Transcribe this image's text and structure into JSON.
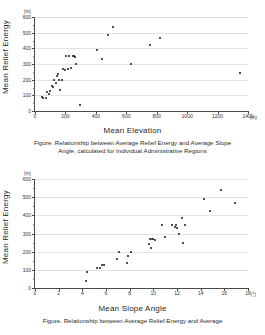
{
  "figures": [
    {
      "id": "relief-vs-elevation",
      "y_axis": {
        "title": "Mean Relief Energy",
        "unit": "(m)",
        "ticks": [
          0,
          100,
          200,
          300,
          400,
          500,
          600
        ],
        "min": 0,
        "max": 600
      },
      "x_axis": {
        "title": "Mean Elevation",
        "unit": "(m)",
        "ticks": [
          0,
          200,
          400,
          600,
          800,
          1000,
          1200,
          1400
        ],
        "min": 0,
        "max": 1400
      },
      "caption_line1": "Figure. Relationship between Average Relief Energy and Average Slope",
      "caption_line2": "Angle, calculated for Individual Administrative Regions"
    },
    {
      "id": "relief-vs-slope",
      "y_axis": {
        "title": "Mean Relief Energy",
        "unit": "(m)",
        "ticks": [
          0,
          100,
          200,
          300,
          400,
          500,
          600
        ],
        "min": 0,
        "max": 600
      },
      "x_axis": {
        "title": "Mean Slope Angle",
        "unit": "(°)",
        "ticks": [
          0,
          2,
          4,
          6,
          8,
          10,
          12,
          14,
          16,
          18
        ],
        "min": 0,
        "max": 18
      },
      "caption_line1": "Figure. Relationship between Average Relief Energy and Average",
      "caption_line2": ""
    }
  ],
  "chart_data": [
    {
      "type": "scatter",
      "title": "",
      "xlabel": "Mean Elevation",
      "ylabel": "Mean Relief Energy",
      "xunit": "(m)",
      "yunit": "(m)",
      "xlim": [
        0,
        1400
      ],
      "ylim": [
        0,
        600
      ],
      "xticks": [
        0,
        200,
        400,
        600,
        800,
        1000,
        1200,
        1400
      ],
      "yticks": [
        0,
        100,
        200,
        300,
        400,
        500,
        600
      ],
      "grid": "horizontal",
      "legend": "none",
      "points": [
        [
          45,
          88
        ],
        [
          55,
          80
        ],
        [
          70,
          83
        ],
        [
          80,
          120
        ],
        [
          90,
          108
        ],
        [
          100,
          128
        ],
        [
          110,
          160
        ],
        [
          120,
          152
        ],
        [
          125,
          196
        ],
        [
          135,
          178
        ],
        [
          145,
          222
        ],
        [
          155,
          200
        ],
        [
          150,
          238
        ],
        [
          165,
          135
        ],
        [
          175,
          198
        ],
        [
          185,
          270
        ],
        [
          195,
          262
        ],
        [
          205,
          348
        ],
        [
          215,
          268
        ],
        [
          225,
          348
        ],
        [
          235,
          272
        ],
        [
          250,
          348
        ],
        [
          258,
          352
        ],
        [
          262,
          345
        ],
        [
          268,
          300
        ],
        [
          295,
          40
        ],
        [
          410,
          388
        ],
        [
          440,
          333
        ],
        [
          478,
          488
        ],
        [
          512,
          538
        ],
        [
          632,
          300
        ],
        [
          758,
          422
        ],
        [
          822,
          468
        ],
        [
          1350,
          245
        ]
      ]
    },
    {
      "type": "scatter",
      "title": "",
      "xlabel": "Mean Slope Angle",
      "ylabel": "Mean Relief Energy",
      "xunit": "(°)",
      "yunit": "(m)",
      "xlim": [
        0,
        18
      ],
      "ylim": [
        0,
        600
      ],
      "xticks": [
        0,
        2,
        4,
        6,
        8,
        10,
        12,
        14,
        16,
        18
      ],
      "yticks": [
        0,
        100,
        200,
        300,
        400,
        500,
        600
      ],
      "grid": "horizontal",
      "legend": "none",
      "points": [
        [
          4.3,
          40
        ],
        [
          4.4,
          88
        ],
        [
          5.2,
          108
        ],
        [
          5.5,
          112
        ],
        [
          5.7,
          125
        ],
        [
          5.8,
          128
        ],
        [
          6.9,
          162
        ],
        [
          7.1,
          196
        ],
        [
          7.8,
          135
        ],
        [
          7.9,
          178
        ],
        [
          8.1,
          200
        ],
        [
          9.6,
          240
        ],
        [
          9.7,
          268
        ],
        [
          9.8,
          222
        ],
        [
          9.9,
          268
        ],
        [
          10.0,
          272
        ],
        [
          10.1,
          265
        ],
        [
          10.7,
          348
        ],
        [
          11.0,
          282
        ],
        [
          11.6,
          345
        ],
        [
          11.8,
          338
        ],
        [
          11.9,
          348
        ],
        [
          12.0,
          332
        ],
        [
          12.2,
          300
        ],
        [
          12.4,
          388
        ],
        [
          12.5,
          248
        ],
        [
          12.7,
          345
        ],
        [
          14.3,
          488
        ],
        [
          14.8,
          422
        ],
        [
          15.7,
          538
        ],
        [
          16.9,
          468
        ]
      ]
    }
  ]
}
